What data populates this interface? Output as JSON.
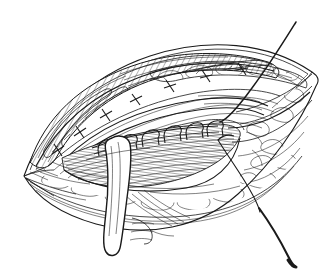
{
  "figure": {
    "domain_label": "Natural-Image",
    "style": "black-and-white pen-and-ink line drawing",
    "background_color": "#ffffff",
    "ink_color": "#1a1a1a",
    "has_text": false,
    "caption": "",
    "parts": [
      {
        "id": "skin-ellipse",
        "label": "Elliptical skin and tissue opening"
      },
      {
        "id": "muscle-band",
        "label": "Hatched muscle fiber band (upper wound edge)"
      },
      {
        "id": "fat-layer-upper",
        "label": "Subcutaneous fat nodules along upper rim"
      },
      {
        "id": "fat-layer-lower",
        "label": "Subcutaneous fat nodules along lower rim"
      },
      {
        "id": "fascia-sheets",
        "label": "Layered fascial sheets inside the wound"
      },
      {
        "id": "deep-cavity",
        "label": "Dense cross-hatched deep cavity floor"
      },
      {
        "id": "suture-row",
        "label": "Row of interrupted suture loops along deep edge"
      },
      {
        "id": "anchor-stitches",
        "label": "Small anchoring stitch marks in muscle band"
      },
      {
        "id": "retractor-blade",
        "label": "Curved white retractor blade"
      },
      {
        "id": "suture-thread-top",
        "label": "Suture thread running to upper right"
      },
      {
        "id": "suture-thread-bottom",
        "label": "Suture thread running to lower right"
      },
      {
        "id": "curved-needle",
        "label": "Curved surgical needle at lower right"
      }
    ]
  }
}
